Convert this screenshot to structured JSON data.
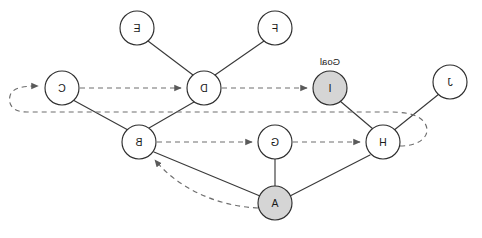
{
  "figure": {
    "kind": "directed-graph-search-diagram",
    "mirrored": true,
    "width": 482,
    "height": 238,
    "background_color": "#ffffff"
  },
  "style": {
    "node_fill_default": "#ffffff",
    "node_fill_highlight": "#d5d5d5",
    "node_stroke": "#2e2e2e",
    "solid_edge_color": "#3a3a3a",
    "dashed_edge_color": "#6e6e6e"
  },
  "annotations": {
    "goal_marker": "Goal"
  },
  "nodes": [
    {
      "id": "F",
      "label": "F",
      "x": 207,
      "y": 28,
      "r": 17,
      "fill": "#ffffff",
      "highlight": false
    },
    {
      "id": "E",
      "label": "E",
      "x": 345,
      "y": 28,
      "r": 17,
      "fill": "#ffffff",
      "highlight": false
    },
    {
      "id": "J",
      "label": "J",
      "x": 32,
      "y": 82,
      "r": 17,
      "fill": "#ffffff",
      "highlight": false
    },
    {
      "id": "I",
      "label": "I",
      "x": 152,
      "y": 88,
      "r": 17,
      "fill": "#d5d5d5",
      "highlight": true,
      "note": "Goal"
    },
    {
      "id": "D",
      "label": "D",
      "x": 278,
      "y": 88,
      "r": 17,
      "fill": "#ffffff",
      "highlight": false
    },
    {
      "id": "C",
      "label": "C",
      "x": 420,
      "y": 88,
      "r": 17,
      "fill": "#ffffff",
      "highlight": false
    },
    {
      "id": "H",
      "label": "H",
      "x": 99,
      "y": 142,
      "r": 17,
      "fill": "#ffffff",
      "highlight": false
    },
    {
      "id": "G",
      "label": "G",
      "x": 207,
      "y": 142,
      "r": 17,
      "fill": "#ffffff",
      "highlight": false
    },
    {
      "id": "B",
      "label": "B",
      "x": 343,
      "y": 142,
      "r": 17,
      "fill": "#ffffff",
      "highlight": false
    },
    {
      "id": "A",
      "label": "A",
      "x": 207,
      "y": 203,
      "r": 17,
      "fill": "#d5d5d5",
      "highlight": true
    }
  ],
  "solid_edges": [
    {
      "from": "F",
      "to": "D"
    },
    {
      "from": "E",
      "to": "D"
    },
    {
      "from": "D",
      "to": "B"
    },
    {
      "from": "C",
      "to": "B"
    },
    {
      "from": "B",
      "to": "A"
    },
    {
      "from": "G",
      "to": "A"
    },
    {
      "from": "A",
      "to": "H"
    },
    {
      "from": "H",
      "to": "I"
    },
    {
      "from": "J",
      "to": "H"
    }
  ],
  "dashed_arrows": [
    {
      "from": "D",
      "to": "I",
      "shape": "straight"
    },
    {
      "from": "C",
      "to": "D",
      "shape": "straight"
    },
    {
      "from": "B",
      "to": "G",
      "shape": "straight"
    },
    {
      "from": "G",
      "to": "H",
      "shape": "straight"
    },
    {
      "from": "A",
      "to": "B",
      "shape": "curve"
    },
    {
      "from": "H",
      "to": "C",
      "shape": "long-loop"
    }
  ]
}
